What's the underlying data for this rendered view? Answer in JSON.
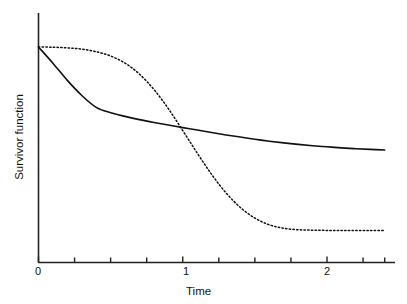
{
  "chart_data": {
    "type": "line",
    "title": "",
    "subtitle": "",
    "xlabel": "Time",
    "ylabel": "Survivor function",
    "xlim": [
      0,
      2.4
    ],
    "ylim": [
      0,
      1
    ],
    "grid": false,
    "legend": null,
    "legend_position": "none",
    "x_ticks": [
      {
        "value": 0,
        "label": "0",
        "type": "major"
      },
      {
        "value": 0.25,
        "label": "",
        "type": "minor"
      },
      {
        "value": 0.5,
        "label": "",
        "type": "minor"
      },
      {
        "value": 0.75,
        "label": "",
        "type": "minor"
      },
      {
        "value": 1,
        "label": "1",
        "type": "major"
      },
      {
        "value": 1.25,
        "label": "",
        "type": "minor"
      },
      {
        "value": 1.5,
        "label": "",
        "type": "minor"
      },
      {
        "value": 1.75,
        "label": "",
        "type": "minor"
      },
      {
        "value": 2,
        "label": "2",
        "type": "major"
      },
      {
        "value": 2.25,
        "label": "",
        "type": "minor"
      },
      {
        "value": 2.4,
        "label": "",
        "type": "minor"
      }
    ],
    "y_ticks": [],
    "axis_color": "#222222",
    "series": [
      {
        "name": "solid-survivor-curve",
        "style": "solid",
        "color": "#111111",
        "width": 1.6,
        "x": [
          0.0,
          0.1,
          0.2,
          0.3,
          0.4,
          0.5,
          0.6,
          0.7,
          0.8,
          0.9,
          1.0,
          1.1,
          1.2,
          1.3,
          1.4,
          1.5,
          1.6,
          1.7,
          1.8,
          1.9,
          2.0,
          2.1,
          2.2,
          2.3,
          2.4
        ],
        "y": [
          1.0,
          0.925,
          0.845,
          0.775,
          0.72,
          0.695,
          0.678,
          0.663,
          0.65,
          0.638,
          0.626,
          0.615,
          0.603,
          0.592,
          0.582,
          0.572,
          0.563,
          0.555,
          0.548,
          0.542,
          0.537,
          0.532,
          0.528,
          0.525,
          0.522
        ]
      },
      {
        "name": "dotted-survivor-curve",
        "style": "dotted",
        "color": "#111111",
        "width": 1.5,
        "x": [
          0.0,
          0.1,
          0.2,
          0.3,
          0.4,
          0.5,
          0.6,
          0.7,
          0.8,
          0.9,
          1.0,
          1.1,
          1.2,
          1.3,
          1.4,
          1.5,
          1.6,
          1.7,
          1.8,
          1.9,
          2.0,
          2.1,
          2.2,
          2.3,
          2.4
        ],
        "y": [
          1.0,
          0.999,
          0.996,
          0.99,
          0.978,
          0.958,
          0.925,
          0.874,
          0.803,
          0.714,
          0.612,
          0.508,
          0.409,
          0.323,
          0.255,
          0.206,
          0.175,
          0.159,
          0.152,
          0.15,
          0.149,
          0.149,
          0.149,
          0.149,
          0.149
        ]
      }
    ],
    "annotations": [
      {
        "name": "curve-crossing",
        "x": 1.14,
        "y": 0.61,
        "label": ""
      }
    ]
  }
}
